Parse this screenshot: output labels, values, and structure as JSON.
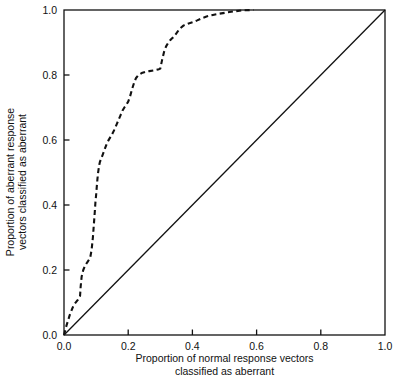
{
  "chart_data": {
    "type": "line",
    "title": "",
    "xlabel": "Proportion of normal response vectors classified as aberrant",
    "xlabel_line1": "Proportion of normal response vectors",
    "xlabel_line2": "classified as aberrant",
    "ylabel": "Proportion of aberrant response vectors classified as aberrant",
    "ylabel_line1": "Proportion of aberrant response",
    "ylabel_line2": "vectors classified as aberrant",
    "xlim": [
      0.0,
      1.0
    ],
    "ylim": [
      0.0,
      1.0
    ],
    "xticks": [
      0.0,
      0.2,
      0.4,
      0.6,
      0.8,
      1.0
    ],
    "yticks": [
      0.0,
      0.2,
      0.4,
      0.6,
      0.8,
      1.0
    ],
    "xtick_labels": [
      "0.0",
      "0.2",
      "0.4",
      "0.6",
      "0.8",
      "1.0"
    ],
    "ytick_labels": [
      "0.0",
      "0.2",
      "0.4",
      "0.6",
      "0.8",
      "1.0"
    ],
    "grid": false,
    "legend": false,
    "frame": "box",
    "series": [
      {
        "name": "ROC curve",
        "style": "dashed",
        "color": "#111111",
        "x": [
          0.0,
          0.008,
          0.018,
          0.03,
          0.043,
          0.05,
          0.052,
          0.055,
          0.06,
          0.065,
          0.07,
          0.074,
          0.078,
          0.082,
          0.086,
          0.09,
          0.093,
          0.096,
          0.098,
          0.1,
          0.102,
          0.104,
          0.106,
          0.108,
          0.11,
          0.112,
          0.115,
          0.118,
          0.121,
          0.124,
          0.128,
          0.133,
          0.138,
          0.144,
          0.15,
          0.157,
          0.164,
          0.17,
          0.176,
          0.182,
          0.188,
          0.194,
          0.2,
          0.206,
          0.212,
          0.218,
          0.224,
          0.232,
          0.242,
          0.254,
          0.266,
          0.278,
          0.288,
          0.296,
          0.3,
          0.306,
          0.312,
          0.318,
          0.324,
          0.33,
          0.336,
          0.342,
          0.35,
          0.36,
          0.372,
          0.386,
          0.4,
          0.415,
          0.43,
          0.444,
          0.46,
          0.48,
          0.505,
          0.53,
          0.56,
          0.59
        ],
        "y": [
          0.0,
          0.03,
          0.062,
          0.092,
          0.108,
          0.12,
          0.15,
          0.18,
          0.2,
          0.212,
          0.22,
          0.226,
          0.232,
          0.24,
          0.262,
          0.3,
          0.34,
          0.38,
          0.41,
          0.43,
          0.455,
          0.478,
          0.498,
          0.512,
          0.524,
          0.533,
          0.54,
          0.548,
          0.556,
          0.564,
          0.575,
          0.588,
          0.598,
          0.608,
          0.618,
          0.632,
          0.648,
          0.662,
          0.676,
          0.69,
          0.7,
          0.708,
          0.718,
          0.735,
          0.756,
          0.775,
          0.79,
          0.8,
          0.806,
          0.81,
          0.812,
          0.814,
          0.816,
          0.818,
          0.82,
          0.848,
          0.872,
          0.888,
          0.898,
          0.906,
          0.912,
          0.918,
          0.928,
          0.942,
          0.952,
          0.958,
          0.962,
          0.968,
          0.975,
          0.98,
          0.984,
          0.988,
          0.992,
          0.996,
          0.999,
          1.0
        ]
      },
      {
        "name": "Chance diagonal",
        "style": "solid",
        "color": "#111111",
        "x": [
          0.0,
          1.0
        ],
        "y": [
          0.0,
          1.0
        ]
      }
    ]
  },
  "axes": {
    "x_title_line1": "Proportion of normal response vectors",
    "x_title_line2": "classified as aberrant",
    "y_title_line1": "Proportion of aberrant response",
    "y_title_line2": "vectors classified as aberrant"
  },
  "ticks": {
    "x": [
      "0.0",
      "0.2",
      "0.4",
      "0.6",
      "0.8",
      "1.0"
    ],
    "y": [
      "0.0",
      "0.2",
      "0.4",
      "0.6",
      "0.8",
      "1.0"
    ]
  },
  "colors": {
    "background": "#ffffff",
    "ink": "#111111",
    "curve": "#111111",
    "diagonal": "#111111"
  }
}
